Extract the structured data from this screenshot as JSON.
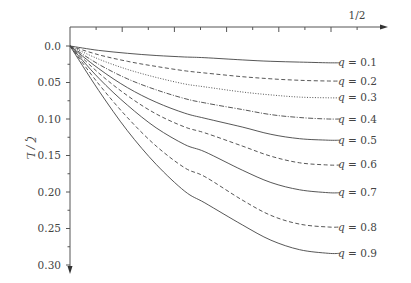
{
  "chart_data": {
    "type": "line",
    "title": "",
    "xlabel": "",
    "ylabel": "ζ / L",
    "x_axis": {
      "position": "top",
      "range": [
        0,
        0.5
      ],
      "labeled_ticks": [
        {
          "value": 0.5,
          "label": "1/2"
        }
      ],
      "minor_tick_step": 0.0227
    },
    "y_axis": {
      "inverted": true,
      "range": [
        0,
        0.3
      ],
      "ticks": [
        0.0,
        0.05,
        0.1,
        0.15,
        0.2,
        0.25,
        0.3
      ],
      "tick_labels": [
        "0.0",
        "0.05",
        "0.10",
        "0.15",
        "0.20",
        "0.25",
        "0.30"
      ]
    },
    "grid": false,
    "legend_position": "inline-right",
    "x": [
      0,
      0.05,
      0.1,
      0.15,
      0.2,
      0.235,
      0.3,
      0.35,
      0.4,
      0.45
    ],
    "series": [
      {
        "name": "q = 0.1",
        "style": "solid",
        "values": [
          0,
          0.006,
          0.01,
          0.013,
          0.015,
          0.016,
          0.019,
          0.021,
          0.022,
          0.023
        ]
      },
      {
        "name": "q = 0.2",
        "style": "dashed",
        "values": [
          0,
          0.012,
          0.021,
          0.028,
          0.034,
          0.037,
          0.042,
          0.045,
          0.047,
          0.048
        ]
      },
      {
        "name": "q = 0.3",
        "style": "dotted",
        "values": [
          0,
          0.018,
          0.032,
          0.043,
          0.052,
          0.056,
          0.063,
          0.067,
          0.07,
          0.071
        ]
      },
      {
        "name": "q = 0.4",
        "style": "dashdot",
        "values": [
          0,
          0.025,
          0.045,
          0.06,
          0.072,
          0.078,
          0.087,
          0.094,
          0.098,
          0.1
        ]
      },
      {
        "name": "q = 0.5",
        "style": "solid",
        "values": [
          0,
          0.031,
          0.057,
          0.077,
          0.092,
          0.099,
          0.111,
          0.121,
          0.127,
          0.129
        ]
      },
      {
        "name": "q = 0.6",
        "style": "dashed",
        "values": [
          0,
          0.037,
          0.068,
          0.093,
          0.111,
          0.119,
          0.137,
          0.151,
          0.16,
          0.163
        ]
      },
      {
        "name": "q = 0.7",
        "style": "solid",
        "values": [
          0,
          0.044,
          0.081,
          0.112,
          0.135,
          0.145,
          0.17,
          0.187,
          0.197,
          0.201
        ]
      },
      {
        "name": "q = 0.8",
        "style": "dashed",
        "values": [
          0,
          0.052,
          0.098,
          0.137,
          0.167,
          0.179,
          0.211,
          0.232,
          0.244,
          0.248
        ]
      },
      {
        "name": "q = 0.9",
        "style": "solid",
        "values": [
          0,
          0.061,
          0.116,
          0.162,
          0.199,
          0.215,
          0.245,
          0.266,
          0.279,
          0.284
        ]
      }
    ]
  }
}
